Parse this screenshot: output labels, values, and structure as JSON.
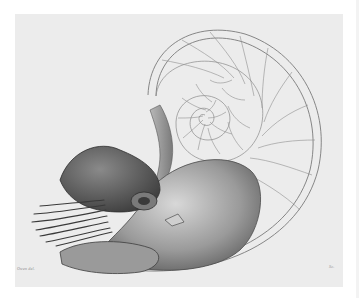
{
  "figure": {
    "background_color": "#ffffff",
    "plate_color": "#ececec",
    "ink_color": "#6a6a6a",
    "spiral_center": [
      198,
      112
    ]
  },
  "captions": {
    "left_signature": "Owen del.",
    "right_signature": "Sc."
  }
}
